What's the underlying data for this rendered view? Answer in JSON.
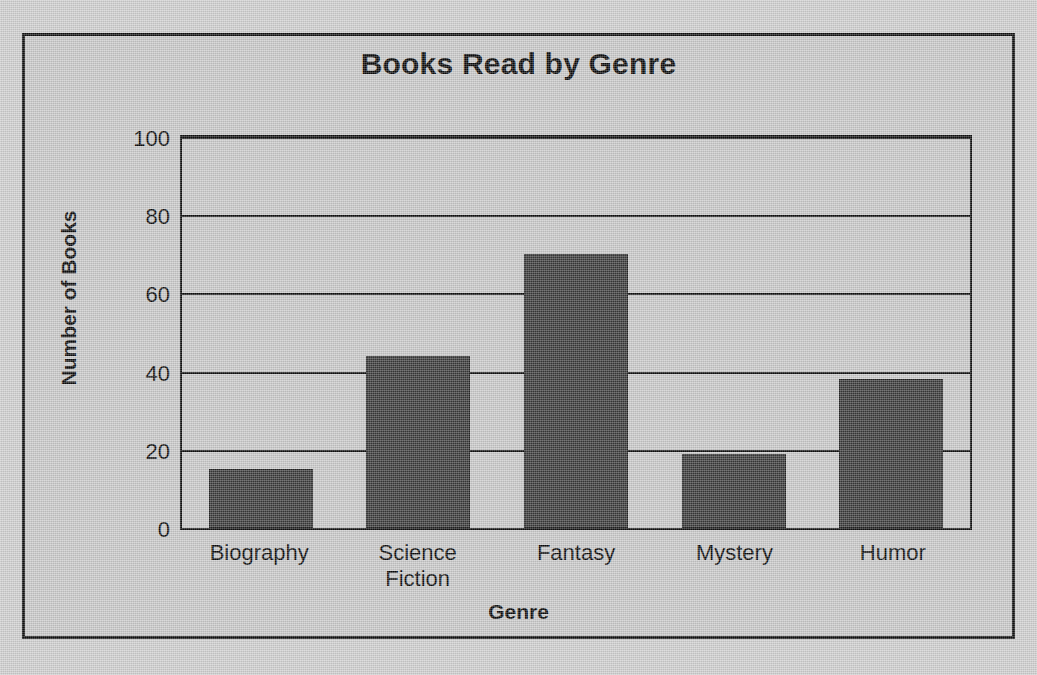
{
  "chart_data": {
    "type": "bar",
    "title": "Books Read by Genre",
    "xlabel": "Genre",
    "ylabel": "Number of Books",
    "categories": [
      "Biography",
      "Science Fiction",
      "Fantasy",
      "Mystery",
      "Humor"
    ],
    "values": [
      15,
      44,
      70,
      19,
      38
    ],
    "ylim": [
      0,
      100
    ],
    "yticks": [
      0,
      20,
      40,
      60,
      80,
      100
    ],
    "ytick_labels": [
      "0",
      "20",
      "40",
      "60",
      "80",
      "100"
    ],
    "grid": true,
    "legend": null,
    "colors": {
      "bar": "#3a3a3a",
      "background": "#cacaca",
      "page_background": "#d0d0d0",
      "axis": "#101010",
      "text": "#0a0a0a"
    }
  },
  "labels": {
    "cat_0_line_1": "Biography",
    "cat_0_line_2": "",
    "cat_1_line_1": "Science",
    "cat_1_line_2": "Fiction",
    "cat_2_line_1": "Fantasy",
    "cat_2_line_2": "",
    "cat_3_line_1": "Mystery",
    "cat_3_line_2": "",
    "cat_4_line_1": "Humor",
    "cat_4_line_2": "",
    "ytick_0": "0",
    "ytick_20": "20",
    "ytick_40": "40",
    "ytick_60": "60",
    "ytick_80": "80",
    "ytick_100": "100"
  }
}
